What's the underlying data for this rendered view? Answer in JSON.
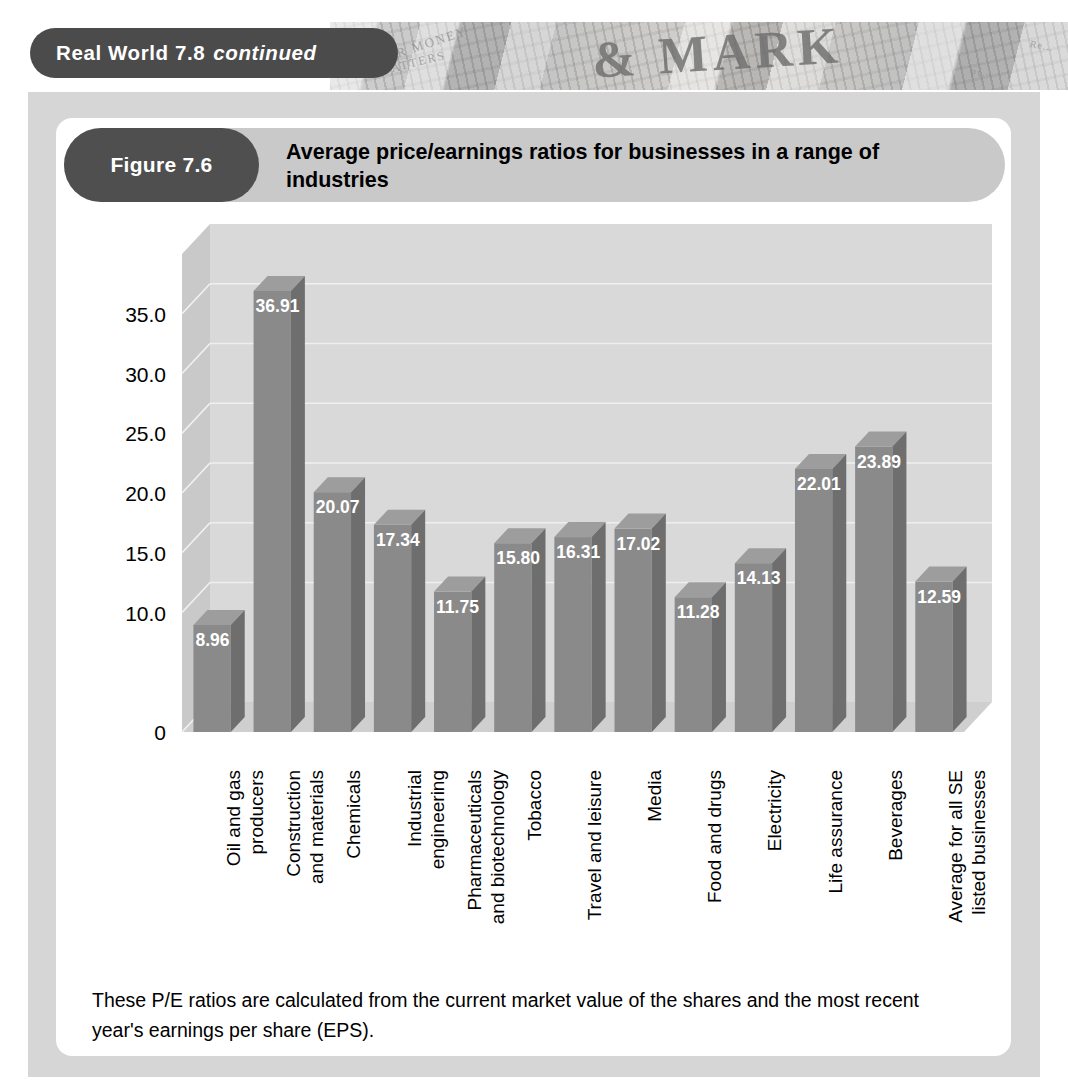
{
  "header": {
    "banner_title": "Real World 7.8",
    "banner_suffix": "continued",
    "newspaper_masthead": "& MARK",
    "newspaper_text_1": "UR MONEY",
    "newspaper_text_2": "MATTERS",
    "newspaper_text_3": "Pr...",
    "newspaper_text_4": "Re..."
  },
  "figure": {
    "number_label": "Figure 7.6",
    "title": "Average price/earnings ratios for businesses in a range of industries",
    "caption": "These P/E ratios are calculated from the current market value of the shares and the most recent year's earnings per share (EPS)."
  },
  "colors": {
    "page_background": "#ffffff",
    "outer_panel": "#d6d6d6",
    "inner_card": "#ffffff",
    "banner_pill": "#4b4b4b",
    "figure_pill": "#4f4f4f",
    "figure_bar": "#c9c9c9",
    "plot_back_wall": "#d9d9d9",
    "plot_left_wall": "#c9c9c9",
    "plot_floor": "#cfcfcf",
    "bar_front": "#8a8a8a",
    "bar_side": "#6e6e6e",
    "bar_top": "#9d9d9d",
    "gridline": "#efefef",
    "bar_label_text": "#ffffff",
    "axis_text": "#000000"
  },
  "chart_data": {
    "type": "bar",
    "title": "Average price/earnings ratios for businesses in a range of industries",
    "xlabel": "",
    "ylabel": "",
    "ylim": [
      0,
      40
    ],
    "grid": true,
    "legend": "none",
    "ytick_labels": [
      "0",
      "10.0",
      "15.0",
      "20.0",
      "25.0",
      "30.0",
      "35.0"
    ],
    "ytick_values": [
      0,
      10,
      15,
      20,
      25,
      30,
      35
    ],
    "categories": [
      "Oil and gas\nproducers",
      "Construction\nand materials",
      "Chemicals",
      "Industrial\nengineering",
      "Pharmaceuticals\nand biotechnology",
      "Tobacco",
      "Travel and leisure",
      "Media",
      "Food and drugs",
      "Electricity",
      "Life assurance",
      "Beverages",
      "Average for all SE\nlisted businesses"
    ],
    "values": [
      8.96,
      36.91,
      20.07,
      17.34,
      11.75,
      15.8,
      16.31,
      17.02,
      11.28,
      14.13,
      22.01,
      23.89,
      12.59
    ],
    "value_labels": [
      "8.96",
      "36.91",
      "20.07",
      "17.34",
      "11.75",
      "15.80",
      "16.31",
      "17.02",
      "11.28",
      "14.13",
      "22.01",
      "23.89",
      "12.59"
    ]
  }
}
